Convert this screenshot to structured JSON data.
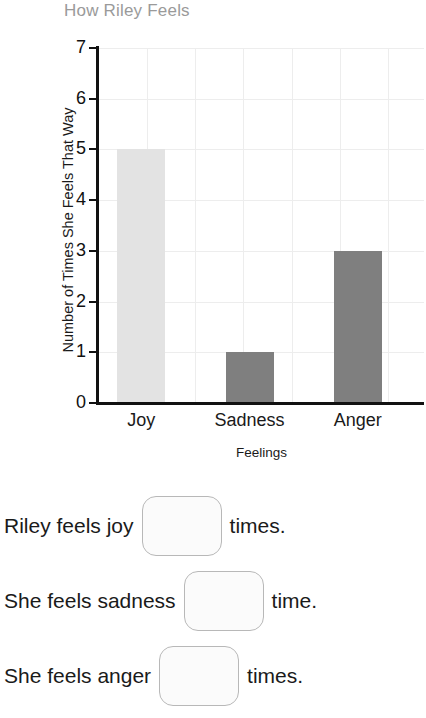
{
  "chart_data": {
    "type": "bar",
    "title": "How Riley Feels",
    "xlabel": "Feelings",
    "ylabel": "Number of Times She Feels That Way",
    "categories": [
      "Joy",
      "Sadness",
      "Anger"
    ],
    "values": [
      5,
      1,
      3
    ],
    "bar_colors": [
      "#e3e3e3",
      "#7f7f7f",
      "#7f7f7f"
    ],
    "ylim": [
      0,
      7
    ],
    "ytick_labels": [
      "0",
      "1",
      "2",
      "3",
      "4",
      "5",
      "6",
      "7"
    ],
    "grid": true,
    "legend": "none",
    "title_color": "#9a9a9a",
    "axis_color": "#111111",
    "grid_color": "#ededed"
  },
  "questions": [
    {
      "before": "Riley feels joy",
      "after": "times.",
      "answer": ""
    },
    {
      "before": "She feels sadness",
      "after": "time.",
      "answer": ""
    },
    {
      "before": "She feels anger",
      "after": "times.",
      "answer": ""
    }
  ]
}
